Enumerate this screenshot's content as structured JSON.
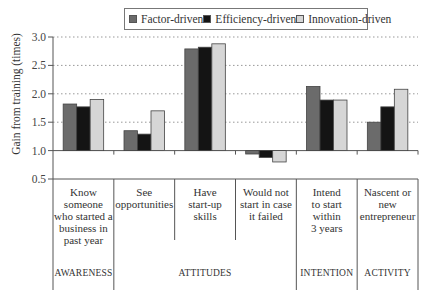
{
  "chart_data": {
    "type": "bar",
    "title": "",
    "xlabel": "",
    "ylabel": "Gain from training (times)",
    "ylim": [
      0.5,
      3.0
    ],
    "baseline": 1.0,
    "yticks": [
      "0.5",
      "1.0",
      "1.5",
      "2.0",
      "2.5",
      "3.0"
    ],
    "ytick_values": [
      0.5,
      1.0,
      1.5,
      2.0,
      2.5,
      3.0
    ],
    "grid": "horizontal dotted",
    "legend_position": "top-center",
    "categories": [
      "Know someone who started a business in past year",
      "See opportunities",
      "Have start-up skills",
      "Would not start in case it failed",
      "Intend to start within 3 years",
      "Nascent or new entrepreneur"
    ],
    "category_lines": [
      [
        "Know",
        "someone",
        "who started a",
        "business in",
        "past year"
      ],
      [
        "See",
        "opportunities"
      ],
      [
        "Have",
        "start-up",
        "skills"
      ],
      [
        "Would not",
        "start in case",
        "it failed"
      ],
      [
        "Intend",
        "to start",
        "within",
        "3 years"
      ],
      [
        "Nascent or",
        "new",
        "entrepreneur"
      ]
    ],
    "groups": [
      {
        "label": "AWARENESS",
        "span": [
          0,
          0
        ]
      },
      {
        "label": "ATTITUDES",
        "span": [
          1,
          3
        ]
      },
      {
        "label": "INTENTION",
        "span": [
          4,
          4
        ]
      },
      {
        "label": "ACTIVITY",
        "span": [
          5,
          5
        ]
      }
    ],
    "series": [
      {
        "name": "Factor-driven",
        "color": "#6b6b6b",
        "values": [
          1.82,
          1.35,
          2.79,
          0.94,
          2.13,
          1.5
        ]
      },
      {
        "name": "Efficiency-driven",
        "color": "#141414",
        "values": [
          1.77,
          1.29,
          2.82,
          0.88,
          1.89,
          1.77
        ]
      },
      {
        "name": "Innovation-driven",
        "color": "#d6d6d6",
        "values": [
          1.9,
          1.7,
          2.88,
          0.8,
          1.89,
          2.08
        ]
      }
    ]
  }
}
